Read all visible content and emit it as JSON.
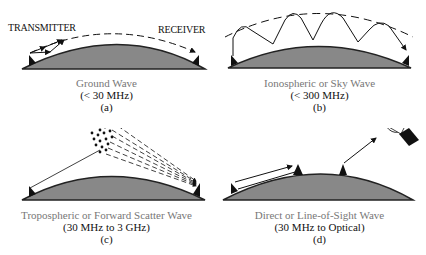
{
  "figure": {
    "panels": [
      {
        "id": "a",
        "title": "Ground Wave",
        "range": "(< 30 MHz)",
        "label": "(a)",
        "annotations": {
          "left": "TRANSMITTER",
          "right": "RECEIVER"
        }
      },
      {
        "id": "b",
        "title": "Ionospheric or Sky Wave",
        "range": "(< 300 MHz)",
        "label": "(b)"
      },
      {
        "id": "c",
        "title": "Tropospheric or Forward Scatter Wave",
        "range": "(30 MHz to 3 GHz)",
        "label": "(c)"
      },
      {
        "id": "d",
        "title": "Direct or Line-of-Sight Wave",
        "range": "(30 MHz to Optical)",
        "label": "(d)"
      }
    ],
    "colors": {
      "earth": "#888888",
      "earth_edge": "#222222",
      "caption_title": "#777777",
      "ink": "#111111"
    }
  }
}
